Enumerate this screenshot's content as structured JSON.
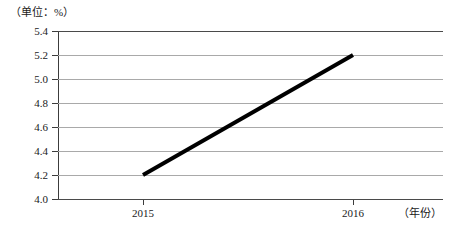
{
  "chart_data": {
    "type": "line",
    "title": "",
    "unit_caption": "（单位：%）",
    "xlabel": "（年份）",
    "ylabel": "",
    "categories": [
      "2015",
      "2016"
    ],
    "x": [
      2015,
      2016
    ],
    "values": [
      4.2,
      5.2
    ],
    "series": [
      {
        "name": "",
        "values": [
          4.2,
          5.2
        ]
      }
    ],
    "ylim": [
      4.0,
      5.4
    ],
    "ytick_step": 0.2,
    "yticks": [
      "5.4",
      "5.2",
      "5.0",
      "4.8",
      "4.6",
      "4.4",
      "4.2",
      "4.0"
    ],
    "ytick_values": [
      5.4,
      5.2,
      5.0,
      4.8,
      4.6,
      4.4,
      4.2,
      4.0
    ],
    "xticks": [
      "2015",
      "2016"
    ],
    "grid": "horizontal",
    "legend": "none",
    "line_color": "#000000",
    "grid_color": "#a9a9a9",
    "axis_color": "#3c3c3c"
  }
}
